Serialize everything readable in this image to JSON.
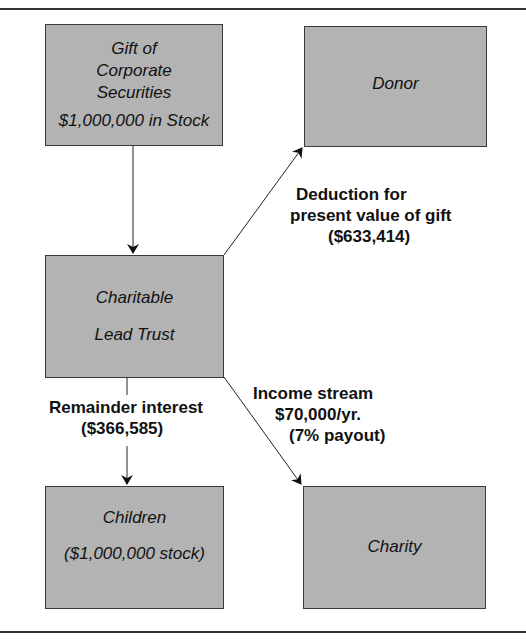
{
  "nodes": {
    "gift": {
      "lines": [
        "Gift of",
        "Corporate",
        "Securities",
        "$1,000,000 in Stock"
      ]
    },
    "donor": {
      "lines": [
        "Donor"
      ]
    },
    "trust": {
      "lines": [
        "Charitable",
        "Lead Trust"
      ]
    },
    "children": {
      "lines": [
        "Children",
        "($1,000,000 stock)"
      ]
    },
    "charity": {
      "lines": [
        "Charity"
      ]
    }
  },
  "edges": {
    "deduction": {
      "lines": [
        "Deduction for",
        "present value of gift",
        "($633,414)"
      ]
    },
    "remainder": {
      "lines": [
        "Remainder interest",
        "($366,585)"
      ]
    },
    "income": {
      "lines": [
        "Income stream",
        "$70,000/yr.",
        "(7% payout)"
      ]
    }
  },
  "colors": {
    "box_fill": "#b3b3b3",
    "border": "#3a3a3a",
    "line": "#222222"
  }
}
